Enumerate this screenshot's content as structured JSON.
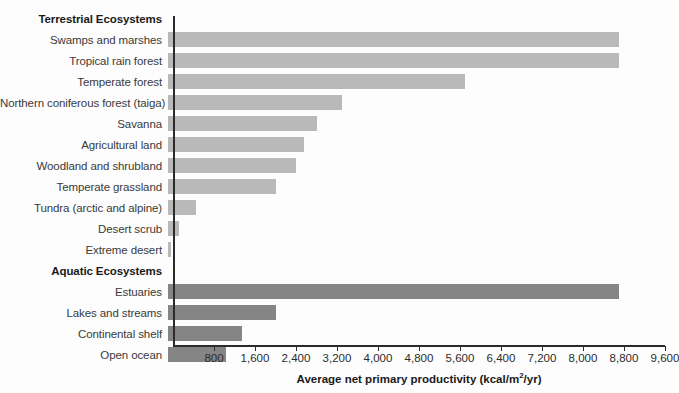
{
  "chart_data": {
    "type": "bar",
    "orientation": "horizontal",
    "title": "",
    "xlabel": "Average net primary productivity (kcal/m2/yr)",
    "xlabel_parts": {
      "main": "Average net primary productivity (kcal/m",
      "sup": "2",
      "tail": "/yr)"
    },
    "ylabel": "",
    "xlim": [
      0,
      9600
    ],
    "xticks": [
      800,
      1600,
      2400,
      3200,
      4000,
      4800,
      5600,
      6400,
      7200,
      8000,
      8800,
      9600
    ],
    "xtick_labels": [
      "800",
      "1,600",
      "2,400",
      "3,200",
      "4,000",
      "4,800",
      "5,600",
      "6,400",
      "7,200",
      "8,000",
      "8,800",
      "9,600"
    ],
    "grid": false,
    "legend": false,
    "colors": {
      "terrestrial_bar": "#b9b9b9",
      "aquatic_bar": "#858585",
      "axis": "#2b2b2b",
      "background": "#fdfdfd",
      "label_text": "#3a3a3a",
      "heading_text": "#1a1a1a"
    },
    "groups": [
      {
        "name": "Terrestrial Ecosystems",
        "series_color": "#b9b9b9",
        "categories": [
          "Swamps and marshes",
          "Tropical rain forest",
          "Temperate forest",
          "Northern coniferous forest (taiga)",
          "Savanna",
          "Agricultural land",
          "Woodland and shrubland",
          "Temperate grassland",
          "Tundra (arctic and alpine)",
          "Desert scrub",
          "Extreme desert"
        ],
        "values": [
          8800,
          8800,
          5800,
          3400,
          2900,
          2650,
          2500,
          2100,
          540,
          220,
          60
        ]
      },
      {
        "name": "Aquatic Ecosystems",
        "series_color": "#858585",
        "categories": [
          "Estuaries",
          "Lakes and streams",
          "Continental shelf",
          "Open ocean"
        ],
        "values": [
          8800,
          2100,
          1450,
          1130
        ]
      }
    ]
  },
  "rows": [
    {
      "kind": "group",
      "label": "Terrestrial Ecosystems",
      "value": null,
      "series": "terrestrial"
    },
    {
      "kind": "bar",
      "label": "Swamps and marshes",
      "value": 8800,
      "series": "terrestrial"
    },
    {
      "kind": "bar",
      "label": "Tropical rain forest",
      "value": 8800,
      "series": "terrestrial"
    },
    {
      "kind": "bar",
      "label": "Temperate forest",
      "value": 5800,
      "series": "terrestrial"
    },
    {
      "kind": "bar",
      "label": "Northern coniferous forest (taiga)",
      "value": 3400,
      "series": "terrestrial"
    },
    {
      "kind": "bar",
      "label": "Savanna",
      "value": 2900,
      "series": "terrestrial"
    },
    {
      "kind": "bar",
      "label": "Agricultural land",
      "value": 2650,
      "series": "terrestrial"
    },
    {
      "kind": "bar",
      "label": "Woodland and shrubland",
      "value": 2500,
      "series": "terrestrial"
    },
    {
      "kind": "bar",
      "label": "Temperate grassland",
      "value": 2100,
      "series": "terrestrial"
    },
    {
      "kind": "bar",
      "label": "Tundra (arctic and alpine)",
      "value": 540,
      "series": "terrestrial"
    },
    {
      "kind": "bar",
      "label": "Desert scrub",
      "value": 220,
      "series": "terrestrial"
    },
    {
      "kind": "bar",
      "label": "Extreme desert",
      "value": 60,
      "series": "terrestrial"
    },
    {
      "kind": "group",
      "label": "Aquatic Ecosystems",
      "value": null,
      "series": "aquatic"
    },
    {
      "kind": "bar",
      "label": "Estuaries",
      "value": 8800,
      "series": "aquatic"
    },
    {
      "kind": "bar",
      "label": "Lakes and streams",
      "value": 2100,
      "series": "aquatic"
    },
    {
      "kind": "bar",
      "label": "Continental shelf",
      "value": 1450,
      "series": "aquatic"
    },
    {
      "kind": "bar",
      "label": "Open ocean",
      "value": 1130,
      "series": "aquatic"
    }
  ]
}
